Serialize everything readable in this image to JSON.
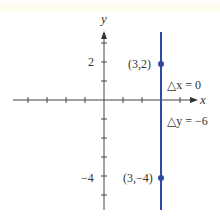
{
  "diagram": {
    "title": "",
    "axes": {
      "x_label": "x",
      "y_label": "y",
      "y_tick_labels": [
        {
          "value": 2,
          "text": "2"
        },
        {
          "value": -4,
          "text": "−4"
        }
      ]
    },
    "line": {
      "type": "vertical",
      "equation_x": 3,
      "color": "#2e4aa6"
    },
    "points": [
      {
        "label": "(3,2)",
        "x": 3,
        "y": 2
      },
      {
        "label": "(3,−4)",
        "x": 3,
        "y": -4
      }
    ],
    "annotations": {
      "delta_x": "△x = 0",
      "delta_y": "△y = −6"
    },
    "colors": {
      "axis": "#444444",
      "line": "#2e4aa6",
      "text": "#333333"
    }
  }
}
